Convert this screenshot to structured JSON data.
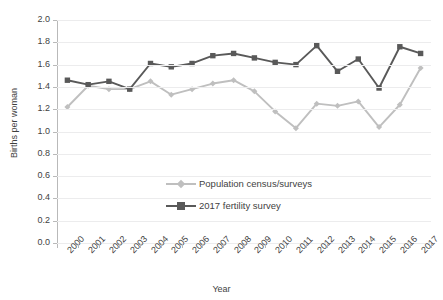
{
  "chart_data": {
    "type": "line",
    "title": "",
    "xlabel": "Year",
    "ylabel": "Births per woman",
    "ylim": [
      0.0,
      2.0
    ],
    "ytick_step": 0.2,
    "grid": true,
    "legend_position": "inside-center-left",
    "categories": [
      "2000",
      "2001",
      "2002",
      "2003",
      "2004",
      "2005",
      "2006",
      "2007",
      "2008",
      "2009",
      "2010",
      "2011",
      "2012",
      "2013",
      "2014",
      "2015",
      "2016",
      "2017"
    ],
    "series": [
      {
        "name": "Population census/surveys",
        "color": "#bfbfbf",
        "marker": "diamond",
        "values": [
          1.22,
          1.41,
          1.38,
          1.38,
          1.45,
          1.33,
          1.38,
          1.43,
          1.46,
          1.36,
          1.18,
          1.03,
          1.25,
          1.23,
          1.27,
          1.04,
          1.24,
          1.57
        ]
      },
      {
        "name": "2017 fertility survey",
        "color": "#595959",
        "marker": "square",
        "values": [
          1.46,
          1.42,
          1.45,
          1.38,
          1.61,
          1.58,
          1.61,
          1.68,
          1.7,
          1.66,
          1.62,
          1.6,
          1.77,
          1.54,
          1.65,
          1.39,
          1.76,
          1.7
        ]
      }
    ],
    "ytick_labels": [
      "2.0",
      "1.8",
      "1.6",
      "1.4",
      "1.2",
      "1.0",
      "0.8",
      "0.6",
      "0.4",
      "0.2",
      "0.0"
    ]
  },
  "axes": {
    "y_title": "Births per woman",
    "x_title": "Year"
  },
  "legend": {
    "items": [
      {
        "label": "Population census/surveys"
      },
      {
        "label": "2017 fertility survey"
      }
    ]
  },
  "colors": {
    "series_light": "#bfbfbf",
    "series_dark": "#595959",
    "gridline": "#ececed",
    "axis": "#b9b9b9",
    "text": "#3f3f3f"
  }
}
